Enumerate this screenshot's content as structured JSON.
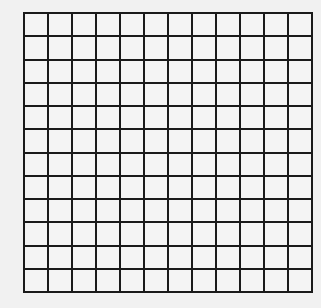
{
  "grid": {
    "columns": 12,
    "rows": 12,
    "left": 24,
    "top": 13,
    "width": 288,
    "height": 279,
    "line_color": "#1a1a1a",
    "line_width": 2,
    "cell_fill": "#f4f4f4",
    "background": "#f1f1f1"
  }
}
